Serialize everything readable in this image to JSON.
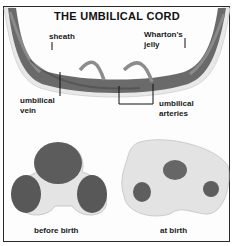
{
  "title": "THE UMBILICAL CORD",
  "labels": {
    "sheath": "sheath",
    "whartons_jelly_1": "Wharton's",
    "whartons_jelly_2": "jelly",
    "umbilical_vein_1": "umbilical",
    "umbilical_vein_2": "vein",
    "umbilical_arteries_1": "umbilical",
    "umbilical_arteries_2": "arteries",
    "before_birth": "before birth",
    "at_birth": "at birth"
  },
  "colors": {
    "sheath": "#e6e6e6",
    "jelly": "#c8c8c8",
    "vessel": "#5a5a5a",
    "vessel_dark": "#454545",
    "border": "#2a2a2a"
  }
}
